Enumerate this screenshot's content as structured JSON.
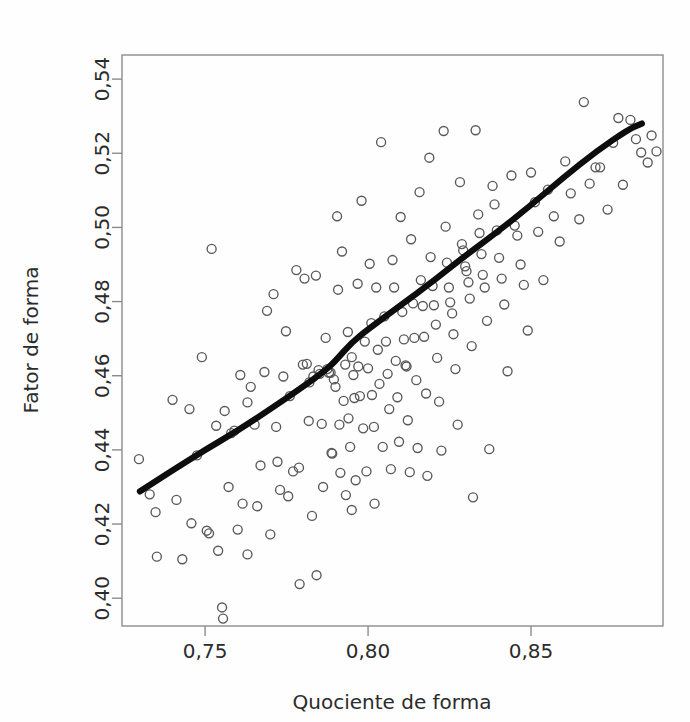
{
  "chart_data": {
    "type": "scatter",
    "title": "",
    "xlabel": "Quociente de forma",
    "ylabel": "Fator de forma",
    "xlim": [
      0.7245,
      0.8905
    ],
    "ylim": [
      0.3925,
      0.5465
    ],
    "xticks": [
      0.75,
      0.8,
      0.85
    ],
    "xticklabels": [
      "0,75",
      "0,80",
      "0,85"
    ],
    "yticks": [
      0.4,
      0.42,
      0.44,
      0.46,
      0.48,
      0.5,
      0.52,
      0.54
    ],
    "yticklabels": [
      "0,40",
      "0,42",
      "0,44",
      "0,46",
      "0,48",
      "0,50",
      "0,52",
      "0,54"
    ],
    "grid": false,
    "legend": null,
    "decimal_separator": ",",
    "marker": {
      "shape": "open-circle",
      "size_px": 9,
      "edge_color": "#595959",
      "fill": "none"
    },
    "trend": {
      "kind": "loess-smooth",
      "color": "#0d0d0d",
      "width_px": 6,
      "points": [
        [
          0.73,
          0.4288
        ],
        [
          0.74,
          0.4345
        ],
        [
          0.75,
          0.44
        ],
        [
          0.76,
          0.4452
        ],
        [
          0.77,
          0.451
        ],
        [
          0.78,
          0.457
        ],
        [
          0.787,
          0.4615
        ],
        [
          0.79,
          0.464
        ],
        [
          0.795,
          0.469
        ],
        [
          0.8,
          0.4725
        ],
        [
          0.81,
          0.479
        ],
        [
          0.82,
          0.4855
        ],
        [
          0.83,
          0.4925
        ],
        [
          0.84,
          0.499
        ],
        [
          0.85,
          0.506
        ],
        [
          0.86,
          0.5135
        ],
        [
          0.87,
          0.5205
        ],
        [
          0.88,
          0.5265
        ],
        [
          0.884,
          0.528
        ]
      ]
    },
    "n_points": 196,
    "points": [
      [
        0.7297,
        0.4375
      ],
      [
        0.733,
        0.428
      ],
      [
        0.7348,
        0.4232
      ],
      [
        0.7352,
        0.4112
      ],
      [
        0.74,
        0.4535
      ],
      [
        0.7412,
        0.4265
      ],
      [
        0.743,
        0.4105
      ],
      [
        0.7452,
        0.451
      ],
      [
        0.7475,
        0.4385
      ],
      [
        0.749,
        0.465
      ],
      [
        0.7505,
        0.4182
      ],
      [
        0.7512,
        0.4175
      ],
      [
        0.752,
        0.4942
      ],
      [
        0.7534,
        0.4465
      ],
      [
        0.754,
        0.4128
      ],
      [
        0.7552,
        0.3975
      ],
      [
        0.7555,
        0.3945
      ],
      [
        0.756,
        0.4505
      ],
      [
        0.7572,
        0.43
      ],
      [
        0.758,
        0.4445
      ],
      [
        0.759,
        0.4452
      ],
      [
        0.76,
        0.4185
      ],
      [
        0.7608,
        0.4602
      ],
      [
        0.7615,
        0.4255
      ],
      [
        0.763,
        0.4528
      ],
      [
        0.764,
        0.457
      ],
      [
        0.7652,
        0.4468
      ],
      [
        0.766,
        0.4248
      ],
      [
        0.767,
        0.4358
      ],
      [
        0.7682,
        0.461
      ],
      [
        0.769,
        0.4775
      ],
      [
        0.77,
        0.4172
      ],
      [
        0.771,
        0.482
      ],
      [
        0.7718,
        0.4462
      ],
      [
        0.7722,
        0.4368
      ],
      [
        0.773,
        0.4292
      ],
      [
        0.774,
        0.4598
      ],
      [
        0.7748,
        0.472
      ],
      [
        0.7755,
        0.4275
      ],
      [
        0.776,
        0.4545
      ],
      [
        0.777,
        0.4342
      ],
      [
        0.778,
        0.4885
      ],
      [
        0.7788,
        0.4352
      ],
      [
        0.779,
        0.4038
      ],
      [
        0.78,
        0.463
      ],
      [
        0.7805,
        0.4862
      ],
      [
        0.7812,
        0.4632
      ],
      [
        0.7818,
        0.4478
      ],
      [
        0.782,
        0.4582
      ],
      [
        0.7828,
        0.4222
      ],
      [
        0.7832,
        0.4598
      ],
      [
        0.784,
        0.487
      ],
      [
        0.7848,
        0.4615
      ],
      [
        0.7852,
        0.4605
      ],
      [
        0.7858,
        0.447
      ],
      [
        0.7862,
        0.43
      ],
      [
        0.787,
        0.4702
      ],
      [
        0.7875,
        0.4618
      ],
      [
        0.788,
        0.4608
      ],
      [
        0.7885,
        0.4608
      ],
      [
        0.7888,
        0.4392
      ],
      [
        0.789,
        0.439
      ],
      [
        0.7895,
        0.459
      ],
      [
        0.79,
        0.457
      ],
      [
        0.7905,
        0.503
      ],
      [
        0.7908,
        0.4832
      ],
      [
        0.7912,
        0.4468
      ],
      [
        0.7915,
        0.4338
      ],
      [
        0.792,
        0.4935
      ],
      [
        0.7925,
        0.4532
      ],
      [
        0.793,
        0.463
      ],
      [
        0.7932,
        0.4278
      ],
      [
        0.7938,
        0.4718
      ],
      [
        0.794,
        0.4485
      ],
      [
        0.7945,
        0.4408
      ],
      [
        0.795,
        0.465
      ],
      [
        0.7955,
        0.4602
      ],
      [
        0.7958,
        0.454
      ],
      [
        0.7962,
        0.4318
      ],
      [
        0.7968,
        0.4848
      ],
      [
        0.797,
        0.4625
      ],
      [
        0.7975,
        0.4545
      ],
      [
        0.798,
        0.5072
      ],
      [
        0.7985,
        0.4458
      ],
      [
        0.799,
        0.4692
      ],
      [
        0.7995,
        0.4342
      ],
      [
        0.8,
        0.462
      ],
      [
        0.8005,
        0.4902
      ],
      [
        0.801,
        0.4742
      ],
      [
        0.8012,
        0.4548
      ],
      [
        0.8018,
        0.4462
      ],
      [
        0.802,
        0.4255
      ],
      [
        0.8025,
        0.4838
      ],
      [
        0.803,
        0.467
      ],
      [
        0.8035,
        0.4578
      ],
      [
        0.804,
        0.523
      ],
      [
        0.8045,
        0.4408
      ],
      [
        0.805,
        0.476
      ],
      [
        0.8055,
        0.4692
      ],
      [
        0.806,
        0.4605
      ],
      [
        0.8065,
        0.451
      ],
      [
        0.807,
        0.4348
      ],
      [
        0.8075,
        0.4912
      ],
      [
        0.808,
        0.4838
      ],
      [
        0.8085,
        0.464
      ],
      [
        0.809,
        0.4542
      ],
      [
        0.8095,
        0.4422
      ],
      [
        0.81,
        0.5028
      ],
      [
        0.8105,
        0.4772
      ],
      [
        0.811,
        0.4698
      ],
      [
        0.8115,
        0.4628
      ],
      [
        0.8118,
        0.4625
      ],
      [
        0.8122,
        0.448
      ],
      [
        0.8128,
        0.434
      ],
      [
        0.8132,
        0.4968
      ],
      [
        0.8138,
        0.4795
      ],
      [
        0.8142,
        0.4702
      ],
      [
        0.8148,
        0.4588
      ],
      [
        0.8152,
        0.4405
      ],
      [
        0.8158,
        0.5095
      ],
      [
        0.8162,
        0.4858
      ],
      [
        0.8168,
        0.4788
      ],
      [
        0.8172,
        0.4705
      ],
      [
        0.8178,
        0.4552
      ],
      [
        0.8182,
        0.433
      ],
      [
        0.8188,
        0.5188
      ],
      [
        0.8192,
        0.492
      ],
      [
        0.8198,
        0.4842
      ],
      [
        0.8202,
        0.479
      ],
      [
        0.8208,
        0.4738
      ],
      [
        0.8212,
        0.4648
      ],
      [
        0.8218,
        0.453
      ],
      [
        0.8225,
        0.4398
      ],
      [
        0.8232,
        0.526
      ],
      [
        0.8238,
        0.5002
      ],
      [
        0.8242,
        0.4905
      ],
      [
        0.8248,
        0.4838
      ],
      [
        0.8252,
        0.4798
      ],
      [
        0.8258,
        0.4768
      ],
      [
        0.8262,
        0.4712
      ],
      [
        0.8268,
        0.4618
      ],
      [
        0.8275,
        0.4468
      ],
      [
        0.8282,
        0.5122
      ],
      [
        0.8288,
        0.4955
      ],
      [
        0.8292,
        0.4938
      ],
      [
        0.8298,
        0.4895
      ],
      [
        0.8302,
        0.4882
      ],
      [
        0.8308,
        0.4852
      ],
      [
        0.8312,
        0.4808
      ],
      [
        0.8318,
        0.468
      ],
      [
        0.8322,
        0.4272
      ],
      [
        0.833,
        0.5262
      ],
      [
        0.8338,
        0.5035
      ],
      [
        0.8342,
        0.4985
      ],
      [
        0.8348,
        0.4928
      ],
      [
        0.8352,
        0.4872
      ],
      [
        0.8358,
        0.4838
      ],
      [
        0.8365,
        0.4748
      ],
      [
        0.8372,
        0.4402
      ],
      [
        0.8382,
        0.5112
      ],
      [
        0.8388,
        0.5062
      ],
      [
        0.8395,
        0.4992
      ],
      [
        0.8402,
        0.4918
      ],
      [
        0.841,
        0.4862
      ],
      [
        0.8418,
        0.4792
      ],
      [
        0.8428,
        0.4612
      ],
      [
        0.844,
        0.514
      ],
      [
        0.845,
        0.5005
      ],
      [
        0.8458,
        0.4978
      ],
      [
        0.8468,
        0.49
      ],
      [
        0.8478,
        0.4845
      ],
      [
        0.849,
        0.4722
      ],
      [
        0.85,
        0.5148
      ],
      [
        0.8512,
        0.5068
      ],
      [
        0.8522,
        0.4988
      ],
      [
        0.8538,
        0.4858
      ],
      [
        0.8552,
        0.5102
      ],
      [
        0.857,
        0.503
      ],
      [
        0.8588,
        0.4962
      ],
      [
        0.8605,
        0.5178
      ],
      [
        0.8622,
        0.5092
      ],
      [
        0.8648,
        0.5022
      ],
      [
        0.8662,
        0.5338
      ],
      [
        0.868,
        0.5118
      ],
      [
        0.8698,
        0.5162
      ],
      [
        0.8712,
        0.5162
      ],
      [
        0.8735,
        0.5048
      ],
      [
        0.8752,
        0.5228
      ],
      [
        0.8768,
        0.5295
      ],
      [
        0.8782,
        0.5115
      ],
      [
        0.8805,
        0.529
      ],
      [
        0.8822,
        0.5238
      ],
      [
        0.8838,
        0.5202
      ],
      [
        0.8858,
        0.5175
      ],
      [
        0.887,
        0.5248
      ],
      [
        0.8885,
        0.5205
      ],
      [
        0.7458,
        0.4202
      ],
      [
        0.763,
        0.4118
      ],
      [
        0.7842,
        0.4062
      ],
      [
        0.795,
        0.4238
      ]
    ]
  },
  "figure": {
    "plot_area": {
      "left": 122,
      "top": 55,
      "right": 663,
      "bottom": 626
    }
  }
}
